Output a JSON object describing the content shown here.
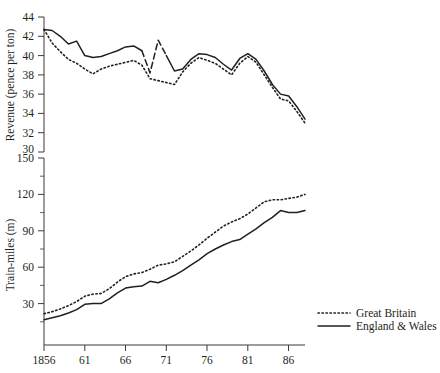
{
  "chart_data": [
    {
      "id": "revenue-panel",
      "type": "line",
      "title": "",
      "xlabel": "",
      "ylabel": "Revenue (pence per ton)",
      "xlim": [
        1856,
        1888
      ],
      "ylim": [
        30,
        44
      ],
      "ytick_values": [
        30,
        32,
        34,
        36,
        38,
        40,
        42,
        44
      ],
      "ytick_labels": [
        "30",
        "32",
        "34",
        "36",
        "38",
        "40",
        "42",
        "44"
      ],
      "xtick_values": [
        1856,
        1861,
        1866,
        1871,
        1876,
        1881,
        1886
      ],
      "xtick_labels": [
        "1856",
        "61",
        "66",
        "71",
        "76",
        "81",
        "86"
      ],
      "grid": false,
      "x": [
        1856,
        1857,
        1858,
        1859,
        1860,
        1861,
        1862,
        1863,
        1864,
        1865,
        1866,
        1867,
        1868,
        1869,
        1870,
        1871,
        1872,
        1873,
        1874,
        1875,
        1876,
        1877,
        1878,
        1879,
        1880,
        1881,
        1882,
        1883,
        1884,
        1885,
        1886,
        1887,
        1888
      ],
      "series": [
        {
          "name": "Great Britain",
          "style": "dotted",
          "values": [
            42.7,
            41.3,
            40.4,
            39.6,
            39.2,
            38.6,
            38.1,
            38.6,
            38.9,
            39.1,
            39.3,
            39.5,
            39.0,
            37.6,
            37.4,
            37.2,
            37.0,
            38.3,
            39.2,
            39.8,
            39.5,
            39.2,
            38.6,
            38.0,
            39.2,
            39.9,
            39.3,
            38.0,
            36.7,
            35.5,
            35.3,
            34.2,
            33.0
          ]
        },
        {
          "name": "England & Wales",
          "style": "solid-with-dashed-gap",
          "values": [
            42.7,
            42.6,
            42.0,
            41.2,
            41.5,
            40.0,
            39.8,
            39.9,
            40.2,
            40.5,
            40.9,
            41.0,
            40.5,
            38.2,
            41.6,
            40.0,
            38.4,
            38.6,
            39.6,
            40.2,
            40.1,
            39.8,
            39.1,
            38.5,
            39.7,
            40.2,
            39.6,
            38.4,
            37.0,
            36.0,
            35.8,
            34.7,
            33.4
          ],
          "dashed_segment_x": [
            1868,
            1869,
            1870,
            1871
          ],
          "note": "segment between 1868 and 1871 drawn with long dashes"
        }
      ]
    },
    {
      "id": "train-miles-panel",
      "type": "line",
      "title": "",
      "xlabel": "",
      "ylabel": "Train-miles (m)",
      "xlim": [
        1856,
        1888
      ],
      "ylim": [
        15,
        155
      ],
      "ytick_values": [
        30,
        60,
        90,
        120,
        150
      ],
      "ytick_labels": [
        "30",
        "60",
        "90",
        "120",
        "150"
      ],
      "xtick_values": [
        1856,
        1861,
        1866,
        1871,
        1876,
        1881,
        1886
      ],
      "xtick_labels": [
        "1856",
        "61",
        "66",
        "71",
        "76",
        "81",
        "86"
      ],
      "grid": false,
      "x": [
        1856,
        1857,
        1858,
        1859,
        1860,
        1861,
        1862,
        1863,
        1864,
        1865,
        1866,
        1867,
        1868,
        1869,
        1870,
        1871,
        1872,
        1873,
        1874,
        1875,
        1876,
        1877,
        1878,
        1879,
        1880,
        1881,
        1882,
        1883,
        1884,
        1885,
        1886,
        1887,
        1888
      ],
      "series": [
        {
          "name": "Great Britain",
          "style": "dotted",
          "values": [
            34.5,
            36.0,
            38.0,
            40.5,
            43.5,
            47.5,
            49.0,
            49.5,
            53.0,
            58.0,
            62.0,
            64.0,
            65.0,
            67.5,
            70.5,
            71.5,
            73.0,
            77.0,
            81.0,
            85.5,
            90.5,
            95.0,
            99.5,
            102.5,
            105.0,
            108.5,
            113.0,
            117.5,
            119.0,
            119.0,
            120.0,
            121.0,
            123.0
          ]
        },
        {
          "name": "England & Wales",
          "style": "solid",
          "values": [
            30.0,
            31.5,
            33.0,
            35.0,
            37.5,
            41.5,
            42.0,
            42.0,
            45.5,
            50.0,
            53.5,
            54.5,
            55.0,
            58.5,
            57.5,
            60.0,
            63.0,
            66.5,
            70.5,
            74.5,
            79.0,
            82.5,
            85.5,
            88.0,
            89.5,
            93.5,
            97.5,
            102.0,
            106.0,
            111.0,
            109.5,
            109.5,
            111.0
          ]
        }
      ],
      "legend": {
        "position": "bottom-right",
        "entries": [
          {
            "label": "Great Britain",
            "style": "dotted"
          },
          {
            "label": "England & Wales",
            "style": "solid"
          }
        ]
      }
    }
  ],
  "axes": {
    "top": {
      "ylabel": "Revenue (pence per ton)",
      "yticks": [
        "44",
        "42",
        "40",
        "38",
        "36",
        "34",
        "32",
        "30"
      ]
    },
    "bottom": {
      "ylabel": "Train-miles (m)",
      "yticks": [
        "150",
        "120",
        "90",
        "60",
        "30"
      ]
    },
    "xticks": [
      "1856",
      "61",
      "66",
      "71",
      "76",
      "81",
      "86"
    ]
  },
  "legend": {
    "great_britain": "Great Britain",
    "england_wales": "England & Wales"
  },
  "colors": {
    "ink": "#231f20",
    "axis": "#3a3a3a",
    "background": "#ffffff"
  }
}
